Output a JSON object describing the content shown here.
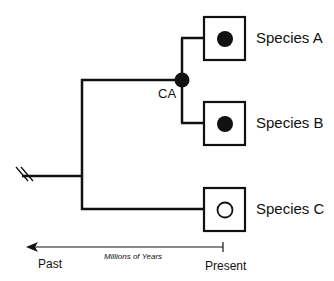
{
  "diagram": {
    "type": "phylogenetic-tree",
    "node_label": "CA",
    "species": [
      {
        "label": "Species A",
        "trait": "filled"
      },
      {
        "label": "Species B",
        "trait": "filled"
      },
      {
        "label": "Species C",
        "trait": "open"
      }
    ],
    "time_axis": {
      "title": "Millions of Years",
      "left_label": "Past",
      "right_label": "Present"
    },
    "colors": {
      "line": "#111111",
      "background": "#ffffff"
    }
  }
}
